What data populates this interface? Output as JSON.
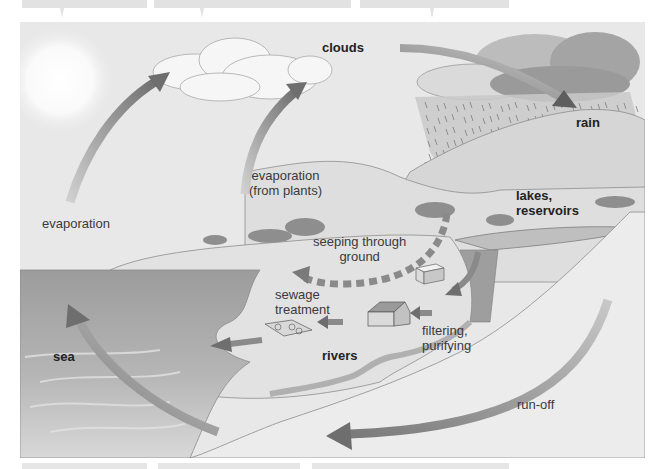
{
  "diagram": {
    "labels": {
      "clouds": "clouds",
      "rain": "rain",
      "evaporation": "evaporation",
      "evaporation_plants_line1": "evaporation",
      "evaporation_plants_line2": "(from plants)",
      "lakes_line1": "lakes,",
      "lakes_line2": "reservoirs",
      "seeping_line1": "seeping through",
      "seeping_line2": "ground",
      "sewage_line1": "sewage",
      "sewage_line2": "treatment",
      "filtering_line1": "filtering,",
      "filtering_line2": "purifying",
      "rivers": "rivers",
      "sea": "sea",
      "runoff": "run-off"
    },
    "flows": [
      {
        "from": "sea",
        "to": "clouds",
        "label": "evaporation"
      },
      {
        "from": "plants",
        "to": "clouds",
        "label": "evaporation (from plants)"
      },
      {
        "from": "clouds",
        "to": "rain",
        "label": "clouds"
      },
      {
        "from": "lakes, reservoirs",
        "to": "filtering, purifying"
      },
      {
        "from": "filtering, purifying",
        "to": "houses"
      },
      {
        "from": "houses",
        "to": "sewage treatment"
      },
      {
        "from": "sewage treatment",
        "to": "rivers"
      },
      {
        "from": "ground",
        "to": "plants",
        "label": "seeping through ground"
      },
      {
        "from": "rivers",
        "to": "sea"
      },
      {
        "from": "hills",
        "to": "sea",
        "label": "run-off"
      }
    ],
    "colors": {
      "sky": "#e9e9e9",
      "sea": "#a9a9a9",
      "land": "#dcdcdc",
      "arrow": "#8a8a8a",
      "arrow_dark": "#6e6e6e",
      "label_text": "#3a3a3a"
    }
  }
}
